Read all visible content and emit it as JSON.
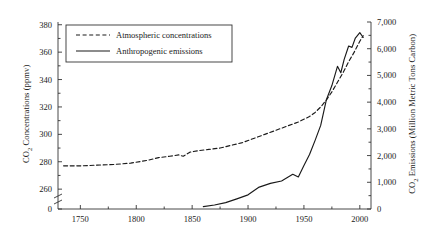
{
  "chart_data": {
    "type": "line",
    "title": "",
    "xlabel": "",
    "xlim": [
      1730,
      2010
    ],
    "xticks": [
      1750,
      1800,
      1850,
      1900,
      1950,
      2000
    ],
    "xticklabels": [
      "1750",
      "1800",
      "1850",
      "1900",
      "1950",
      "2000"
    ],
    "xminorticks": [
      1775,
      1825,
      1875,
      1925,
      1975
    ],
    "grid": false,
    "legend_position": "upper left",
    "axis_break_left": true,
    "left_axis": {
      "label": "CO2 Concentrations (ppmv)",
      "label_parts": {
        "pre": "CO",
        "sub": "2",
        "post": " Concentrations (ppmv)"
      },
      "ticks": [
        260,
        280,
        300,
        320,
        340,
        360,
        380
      ],
      "ticklabels": [
        "260",
        "280",
        "300",
        "320",
        "340",
        "360",
        "380"
      ],
      "extra_tick": 0,
      "extra_ticklabel": "0",
      "minor_tick_step": 10,
      "range_displayed": [
        255,
        382
      ]
    },
    "right_axis": {
      "label": "CO2 Emissions (Million Metric Tons Carbon)",
      "label_parts": {
        "pre": "CO",
        "sub": "2",
        "post": " Emissions (Million Metric Tons Carbon)"
      },
      "ticks": [
        0,
        1000,
        2000,
        3000,
        4000,
        5000,
        6000,
        7000
      ],
      "ticklabels": [
        "0",
        "1,000",
        "2,000",
        "3,000",
        "4,000",
        "5,000",
        "6,000",
        "7,000"
      ],
      "minor_tick_step": 500,
      "range": [
        0,
        7000
      ]
    },
    "series": [
      {
        "name": "Atmospheric concentrations",
        "style": "dashed",
        "color": "#1a1a1a",
        "axis": "left",
        "units": "ppmv",
        "x": [
          1735,
          1750,
          1765,
          1780,
          1795,
          1810,
          1820,
          1830,
          1838,
          1842,
          1848,
          1855,
          1865,
          1875,
          1885,
          1895,
          1905,
          1915,
          1925,
          1935,
          1945,
          1955,
          1960,
          1965,
          1970,
          1975,
          1980,
          1985,
          1990,
          1995,
          2000,
          2003
        ],
        "y": [
          277,
          277,
          277.5,
          278,
          279,
          281,
          283,
          284,
          285,
          284,
          287,
          288,
          289,
          290,
          292,
          294,
          297,
          300,
          303,
          306,
          309,
          313,
          316,
          320,
          325,
          331,
          338,
          345,
          353,
          360,
          368,
          372
        ]
      },
      {
        "name": "Anthropogenic emissions",
        "style": "solid",
        "color": "#1a1a1a",
        "axis": "right",
        "units": "Million Metric Tons Carbon",
        "x": [
          1860,
          1870,
          1880,
          1890,
          1900,
          1910,
          1920,
          1930,
          1940,
          1945,
          1950,
          1955,
          1960,
          1965,
          1970,
          1975,
          1980,
          1983,
          1986,
          1990,
          1993,
          1996,
          2000,
          2003
        ],
        "y": [
          90,
          150,
          240,
          380,
          530,
          820,
          960,
          1050,
          1300,
          1200,
          1630,
          2040,
          2570,
          3130,
          4080,
          4620,
          5340,
          5100,
          5600,
          6100,
          6050,
          6400,
          6600,
          6420
        ]
      }
    ],
    "legend_entries": [
      {
        "label": "Atmospheric concentrations",
        "style": "dashed"
      },
      {
        "label": "Anthropogenic emissions",
        "style": "solid"
      }
    ]
  }
}
